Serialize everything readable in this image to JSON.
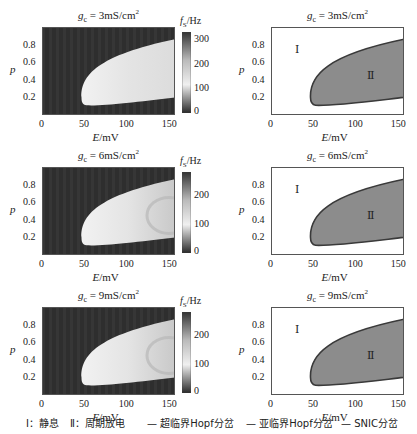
{
  "chart_data": [
    {
      "type": "heatmap",
      "title": "g_c = 3mS/cm²",
      "title_parts": {
        "var": "g",
        "sub": "c",
        "rest": " = 3mS/cm",
        "sup": "2"
      },
      "xlabel": "E/mV",
      "ylabel": "p",
      "xlim": [
        0,
        155
      ],
      "ylim": [
        0,
        1
      ],
      "xticks": [
        "0",
        "50",
        "100",
        "150"
      ],
      "yticks": [
        "0.2",
        "0.4",
        "0.6",
        "0.8"
      ],
      "colorbar": {
        "label": "f_S/Hz",
        "ticks": [
          "0",
          "100",
          "200",
          "300"
        ],
        "range": [
          0,
          330
        ]
      },
      "description": "Firing frequency; bright (~100-150 Hz) region bounded by E≈45 mV on left, p from ~0.1-0.2 to ~0.85; dark (0 Hz) elsewhere"
    },
    {
      "type": "area",
      "title": "g_c = 3mS/cm²",
      "title_parts": {
        "var": "g",
        "sub": "c",
        "rest": " = 3mS/cm",
        "sup": "2"
      },
      "xlabel": "E/mV",
      "ylabel": "p",
      "xlim": [
        0,
        155
      ],
      "ylim": [
        0,
        1
      ],
      "xticks": [
        "0",
        "50",
        "100",
        "150"
      ],
      "yticks": [
        "0.2",
        "0.4",
        "0.6",
        "0.8"
      ],
      "regions": [
        {
          "label": "Ⅰ",
          "x": 28,
          "y": 0.75
        },
        {
          "label": "Ⅱ",
          "x": 118,
          "y": 0.48
        }
      ],
      "boundary_upper": [
        [
          46,
          0.2
        ],
        [
          55,
          0.45
        ],
        [
          70,
          0.62
        ],
        [
          100,
          0.76
        ],
        [
          155,
          0.86
        ]
      ],
      "boundary_lower": [
        [
          46,
          0.2
        ],
        [
          48,
          0.12
        ],
        [
          60,
          0.11
        ],
        [
          100,
          0.14
        ],
        [
          155,
          0.2
        ]
      ]
    },
    {
      "type": "heatmap",
      "title": "g_c = 6mS/cm²",
      "title_parts": {
        "var": "g",
        "sub": "c",
        "rest": " = 6mS/cm",
        "sup": "2"
      },
      "xlabel": "E/mV",
      "ylabel": "p",
      "xlim": [
        0,
        155
      ],
      "ylim": [
        0,
        1
      ],
      "xticks": [
        "0",
        "50",
        "100",
        "150"
      ],
      "yticks": [
        "0.2",
        "0.4",
        "0.6",
        "0.8"
      ],
      "colorbar": {
        "label": "f_S/Hz",
        "ticks": [
          "0",
          "100",
          "200"
        ],
        "range": [
          0,
          280
        ]
      }
    },
    {
      "type": "area",
      "title": "g_c = 6mS/cm²",
      "title_parts": {
        "var": "g",
        "sub": "c",
        "rest": " = 6mS/cm",
        "sup": "2"
      },
      "xlabel": "E/mV",
      "ylabel": "p",
      "xlim": [
        0,
        155
      ],
      "ylim": [
        0,
        1
      ],
      "xticks": [
        "0",
        "50",
        "100",
        "150"
      ],
      "yticks": [
        "0.2",
        "0.4",
        "0.6",
        "0.8"
      ],
      "regions": [
        {
          "label": "Ⅰ",
          "x": 28,
          "y": 0.75
        },
        {
          "label": "Ⅱ",
          "x": 118,
          "y": 0.45
        }
      ]
    },
    {
      "type": "heatmap",
      "title": "g_c = 9mS/cm²",
      "title_parts": {
        "var": "g",
        "sub": "c",
        "rest": " = 9mS/cm",
        "sup": "2"
      },
      "xlabel": "E/mV",
      "ylabel": "p",
      "xlim": [
        0,
        155
      ],
      "ylim": [
        0,
        1
      ],
      "xticks": [
        "0",
        "50",
        "100",
        "150"
      ],
      "yticks": [
        "0.2",
        "0.4",
        "0.6",
        "0.8"
      ],
      "colorbar": {
        "label": "f_S/Hz",
        "ticks": [
          "0",
          "100",
          "200"
        ],
        "range": [
          0,
          280
        ]
      }
    },
    {
      "type": "area",
      "title": "g_c = 9mS/cm²",
      "title_parts": {
        "var": "g",
        "sub": "c",
        "rest": " = 9mS/cm",
        "sup": "2"
      },
      "xlabel": "E/mV",
      "ylabel": "p",
      "xlim": [
        0,
        155
      ],
      "ylim": [
        0,
        1
      ],
      "xticks": [
        "0",
        "50",
        "100",
        "150"
      ],
      "yticks": [
        "0.2",
        "0.4",
        "0.6",
        "0.8"
      ],
      "regions": [
        {
          "label": "Ⅰ",
          "x": 28,
          "y": 0.75
        },
        {
          "label": "Ⅱ",
          "x": 110,
          "y": 0.45
        }
      ]
    }
  ],
  "legend": {
    "region_1": "Ⅰ：静息",
    "region_2": "Ⅱ：周期放电",
    "line_1": "— 超临界Hopf分岔",
    "line_2": "— 亚临界Hopf分岔",
    "line_3": "— SNIC分岔"
  },
  "axis_labels": {
    "y": "p",
    "x_var": "E",
    "x_unit": "/mV",
    "cb_var": "f",
    "cb_sub": "S",
    "cb_unit": "/Hz"
  },
  "colors": {
    "dark": "#2f2f2f",
    "bright": "#e6e6e6",
    "region2": "#8a8a8a",
    "boundary": "#333333"
  }
}
